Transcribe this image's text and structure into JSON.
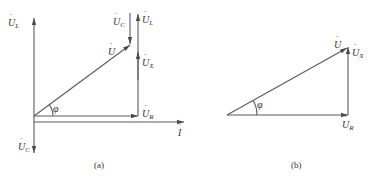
{
  "diagram_a": {
    "caption": "(a)",
    "labels": {
      "UL_axis": {
        "main": "U",
        "sub": "L"
      },
      "UC_axis": {
        "main": "U",
        "sub": "C"
      },
      "UC_top": {
        "main": "U",
        "sub": "C"
      },
      "UL_right": {
        "main": "U",
        "sub": "L"
      },
      "U": {
        "main": "U",
        "sub": ""
      },
      "UX": {
        "main": "U",
        "sub": "X"
      },
      "UR": {
        "main": "U",
        "sub": "R"
      },
      "I": {
        "main": "I",
        "sub": ""
      },
      "phi": "φ"
    }
  },
  "diagram_b": {
    "caption": "(b)",
    "labels": {
      "U": {
        "main": "U",
        "sub": ""
      },
      "UX": {
        "main": "U",
        "sub": "X"
      },
      "UR": {
        "main": "U",
        "sub": "R"
      },
      "phi": "φ"
    }
  },
  "dot_glyph": "·"
}
